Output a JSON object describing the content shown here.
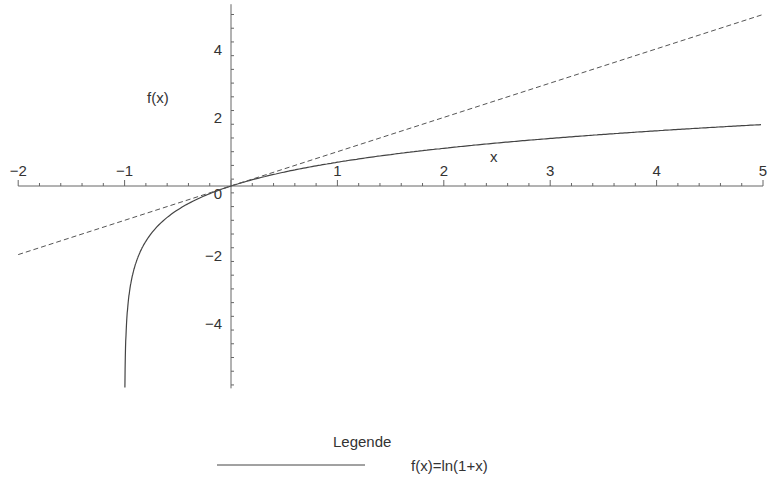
{
  "chart_data": {
    "type": "line",
    "title": "",
    "xlabel": "x",
    "ylabel": "f(x)",
    "xlim": [
      -2,
      5
    ],
    "ylim": [
      -5.9,
      5.3
    ],
    "grid": false,
    "x_ticks": [
      "−2",
      "−1",
      "0",
      "1",
      "2",
      "3",
      "4",
      "5"
    ],
    "y_ticks": [
      "−4",
      "−2",
      "2",
      "4"
    ],
    "series": [
      {
        "name": "f(x)=ln(1+x)",
        "style": "solid",
        "x": [
          -0.997,
          -0.99,
          -0.95,
          -0.9,
          -0.8,
          -0.6,
          -0.4,
          -0.2,
          0,
          0.5,
          1,
          2,
          3,
          4,
          5
        ],
        "y": [
          -5.8,
          -4.61,
          -3.0,
          -2.3,
          -1.61,
          -0.92,
          -0.51,
          -0.22,
          0,
          0.41,
          0.69,
          1.1,
          1.39,
          1.61,
          1.79
        ]
      },
      {
        "name": "y=x",
        "style": "dashed",
        "x": [
          -2,
          5
        ],
        "y": [
          -2,
          5
        ]
      }
    ],
    "legend": {
      "title": "Legende",
      "entries": [
        "f(x)=ln(1+x)"
      ],
      "position": "bottom"
    }
  }
}
